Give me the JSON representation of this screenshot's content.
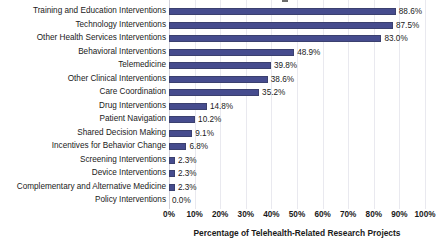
{
  "chart_data": {
    "type": "bar",
    "orientation": "horizontal",
    "title": "",
    "xlabel": "Percentage of Telehealth-Related Research Projects",
    "ylabel": "",
    "xlim": [
      0,
      100
    ],
    "xtick_labels": [
      "0%",
      "10%",
      "20%",
      "30%",
      "40%",
      "50%",
      "60%",
      "70%",
      "80%",
      "90%",
      "100%"
    ],
    "xticks": [
      0,
      10,
      20,
      30,
      40,
      50,
      60,
      70,
      80,
      90,
      100
    ],
    "grid": "vertical",
    "legend": "none",
    "bar_color": "#464c8e",
    "categories": [
      "Training and Education Interventions",
      "Technology Interventions",
      "Other Health Services Interventions",
      "Behavioral Interventions",
      "Telemedicine",
      "Other Clinical Interventions",
      "Care Coordination",
      "Drug Interventions",
      "Patient Navigation",
      "Shared Decision Making",
      "Incentives for Behavior Change",
      "Screening Interventions",
      "Device Interventions",
      "Complementary and Alternative Medicine",
      "Policy Interventions"
    ],
    "values": [
      88.6,
      87.5,
      83.0,
      48.9,
      39.8,
      38.6,
      35.2,
      14.8,
      10.2,
      9.1,
      6.8,
      2.3,
      2.3,
      2.3,
      0.0
    ],
    "value_labels": [
      "88.6%",
      "87.5%",
      "83.0%",
      "48.9%",
      "39.8%",
      "38.6%",
      "35.2%",
      "14.8%",
      "10.2%",
      "9.1%",
      "6.8%",
      "2.3%",
      "2.3%",
      "2.3%",
      "0.0%"
    ]
  }
}
